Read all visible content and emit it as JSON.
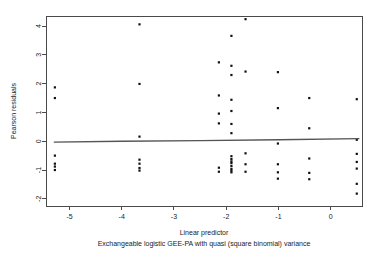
{
  "chart_data": {
    "type": "scatter",
    "title": "",
    "xlabel": "Linear predictor",
    "sublabel": "Exchangeable logistic GEE-PA with quasi (square binomial) variance",
    "ylabel": "Pearson residuals",
    "xlim": [
      -5.45,
      0.6
    ],
    "ylim": [
      -2.25,
      4.35
    ],
    "xticks": [
      -5,
      -4,
      -3,
      -2,
      -1,
      0
    ],
    "xticklabels": [
      "-5",
      "-4",
      "-3",
      "-2",
      "-1",
      "0"
    ],
    "yticks": [
      4,
      3,
      2,
      1,
      0,
      -1,
      -2
    ],
    "yticklabels": [
      "4",
      "3",
      "2",
      "1",
      "0",
      "-1",
      "-2"
    ],
    "grid": false,
    "legend": null,
    "point_color": "#111111",
    "line_color": "#555555",
    "axis_color": "#4a4a4a",
    "background": "#ffffff",
    "series": [
      {
        "name": "Pearson residuals",
        "marker": "square",
        "points": [
          [
            -5.28,
            1.87
          ],
          [
            -5.28,
            1.5
          ],
          [
            -5.28,
            -0.5
          ],
          [
            -5.28,
            -0.78
          ],
          [
            -5.28,
            -0.88
          ],
          [
            -5.28,
            -1.0
          ],
          [
            -3.66,
            4.06
          ],
          [
            -3.66,
            1.99
          ],
          [
            -3.66,
            0.16
          ],
          [
            -3.66,
            -0.64
          ],
          [
            -3.66,
            -0.78
          ],
          [
            -3.66,
            -0.93
          ],
          [
            -3.66,
            -1.02
          ],
          [
            -2.14,
            2.74
          ],
          [
            -2.14,
            1.59
          ],
          [
            -2.14,
            0.96
          ],
          [
            -2.14,
            0.62
          ],
          [
            -2.14,
            -0.92
          ],
          [
            -2.14,
            -1.06
          ],
          [
            -1.9,
            3.66
          ],
          [
            -1.9,
            2.62
          ],
          [
            -1.9,
            2.3
          ],
          [
            -1.9,
            1.44
          ],
          [
            -1.9,
            1.05
          ],
          [
            -1.9,
            0.6
          ],
          [
            -1.9,
            0.28
          ],
          [
            -1.9,
            -0.52
          ],
          [
            -1.9,
            -0.62
          ],
          [
            -1.9,
            -0.7
          ],
          [
            -1.9,
            -0.76
          ],
          [
            -1.9,
            -0.86
          ],
          [
            -1.9,
            -0.96
          ],
          [
            -1.9,
            -1.02
          ],
          [
            -1.9,
            -1.08
          ],
          [
            -1.63,
            4.24
          ],
          [
            -1.63,
            2.42
          ],
          [
            -1.63,
            -0.42
          ],
          [
            -1.63,
            -0.8
          ],
          [
            -1.63,
            -1.06
          ],
          [
            -1.01,
            2.4
          ],
          [
            -1.01,
            1.15
          ],
          [
            -1.01,
            -0.08
          ],
          [
            -1.01,
            -0.8
          ],
          [
            -1.01,
            -1.08
          ],
          [
            -1.01,
            -1.3
          ],
          [
            -0.41,
            1.5
          ],
          [
            -0.41,
            0.45
          ],
          [
            -0.41,
            -0.6
          ],
          [
            -0.41,
            -1.1
          ],
          [
            -0.41,
            -1.32
          ],
          [
            0.5,
            1.46
          ],
          [
            0.5,
            0.05
          ],
          [
            0.5,
            -0.44
          ],
          [
            0.5,
            -0.72
          ],
          [
            0.5,
            -0.95
          ],
          [
            0.5,
            -1.48
          ],
          [
            0.5,
            -1.82
          ]
        ]
      }
    ],
    "fit_line": {
      "name": "lowess smooth",
      "points": [
        [
          -5.3,
          -0.03
        ],
        [
          -4.0,
          0.0
        ],
        [
          -2.5,
          0.02
        ],
        [
          -1.0,
          0.05
        ],
        [
          0.55,
          0.09
        ]
      ]
    }
  }
}
